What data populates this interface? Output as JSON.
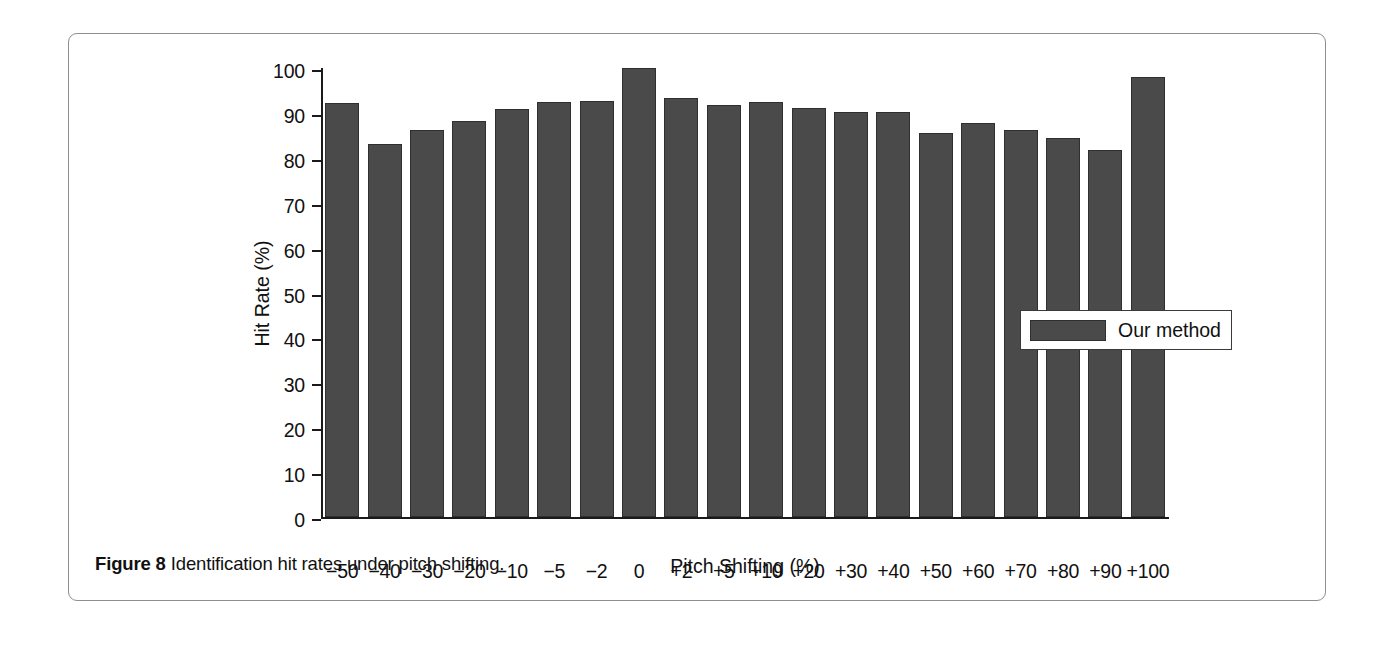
{
  "figure": {
    "caption_label": "Figure 8",
    "caption_text": "Identification hit rates under pitch shifting.",
    "border_color": "#8e8e8e"
  },
  "legend": {
    "position": "inside-right",
    "entries": [
      {
        "label": "Our method",
        "color": "#4a4a4a"
      }
    ]
  },
  "chart_data": {
    "type": "bar",
    "title": "",
    "subtitle": "",
    "xlabel": "Pitch Shifting (%)",
    "ylabel": "Hit Rate (%)",
    "ylim": [
      0,
      100
    ],
    "ytick_step": 10,
    "yticks": [
      0,
      10,
      20,
      30,
      40,
      50,
      60,
      70,
      80,
      90,
      100
    ],
    "grid": false,
    "bar_color": "#4a4a4a",
    "bar_edge_color": "#2f2f2f",
    "legend_position": "center right",
    "categories": [
      "−50",
      "−40",
      "−30",
      "−20",
      "−10",
      "−5",
      "−2",
      "0",
      "+2",
      "+5",
      "+10",
      "+20",
      "+30",
      "+40",
      "+50",
      "+60",
      "+70",
      "+80",
      "+90",
      "+100"
    ],
    "series": [
      {
        "name": "Our method",
        "values": [
          92.3,
          83.0,
          86.3,
          88.2,
          90.8,
          92.4,
          92.6,
          100.0,
          93.4,
          91.8,
          92.4,
          91.2,
          90.3,
          90.2,
          85.5,
          87.8,
          86.1,
          84.4,
          81.8,
          97.9
        ]
      }
    ]
  }
}
